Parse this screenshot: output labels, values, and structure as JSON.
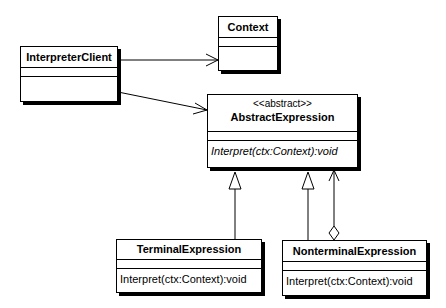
{
  "diagram": {
    "type": "UML class diagram",
    "classes": [
      {
        "id": "interpreter-client",
        "name": "InterpreterClient",
        "stereotype": null,
        "methods": []
      },
      {
        "id": "context",
        "name": "Context",
        "stereotype": null,
        "methods": []
      },
      {
        "id": "abstract-expression",
        "name": "AbstractExpression",
        "stereotype": "<<abstract>>",
        "methods": [
          {
            "signature": "Interpret(ctx:Context):void",
            "italic": true
          }
        ]
      },
      {
        "id": "terminal-expression",
        "name": "TerminalExpression",
        "stereotype": null,
        "methods": [
          {
            "signature": "Interpret(ctx:Context):void",
            "italic": false
          }
        ]
      },
      {
        "id": "nonterminal-expression",
        "name": "NonterminalExpression",
        "stereotype": null,
        "methods": [
          {
            "signature": "Interpret(ctx:Context):void",
            "italic": false
          }
        ]
      }
    ],
    "relationships": [
      {
        "from": "InterpreterClient",
        "to": "Context",
        "type": "association",
        "navigable": true
      },
      {
        "from": "InterpreterClient",
        "to": "AbstractExpression",
        "type": "association",
        "navigable": true
      },
      {
        "from": "TerminalExpression",
        "to": "AbstractExpression",
        "type": "generalization"
      },
      {
        "from": "NonterminalExpression",
        "to": "AbstractExpression",
        "type": "generalization"
      },
      {
        "from": "NonterminalExpression",
        "to": "AbstractExpression",
        "type": "aggregation",
        "navigable": true
      }
    ]
  }
}
